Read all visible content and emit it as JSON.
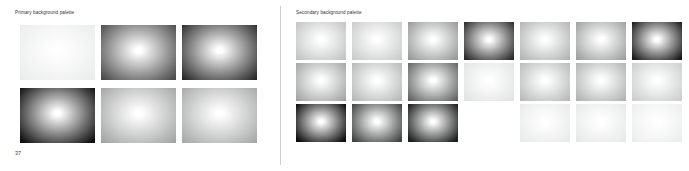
{
  "page": {
    "page_number": "37",
    "background_color": "#ffffff",
    "divider_color": "#cfcfcf"
  },
  "panels": [
    {
      "id": "primary",
      "title": "Primary background palette",
      "columns": 7,
      "swatches": [
        {
          "name": "swatch-1",
          "center": "#ffffff",
          "edge": "#e6e8e7",
          "midstop": 54
        },
        {
          "name": "swatch-2",
          "center": "#ffffff",
          "edge": "#4a4a4a",
          "midstop": 40
        },
        {
          "name": "swatch-3",
          "center": "#ffffff",
          "edge": "#2a2a2a",
          "midstop": 40
        },
        {
          "name": "swatch-4",
          "center": "#ffffff",
          "edge": "#121212",
          "midstop": 38
        },
        {
          "name": "swatch-5",
          "center": "#ffffff",
          "edge": "#9a9c9b",
          "midstop": 46
        },
        {
          "name": "swatch-6",
          "center": "#ffffff",
          "edge": "#9fa1a0",
          "midstop": 46
        }
      ]
    },
    {
      "id": "secondary",
      "title": "Secondary background palette",
      "columns": 7,
      "swatches": [
        {
          "name": "swatch-1",
          "center": "#ffffff",
          "edge": "#b9bcbb",
          "midstop": 48
        },
        {
          "name": "swatch-2",
          "center": "#ffffff",
          "edge": "#c2c4c3",
          "midstop": 48
        },
        {
          "name": "swatch-3",
          "center": "#ffffff",
          "edge": "#8e9190",
          "midstop": 44
        },
        {
          "name": "swatch-4",
          "center": "#ffffff",
          "edge": "#2b2b2b",
          "midstop": 38
        },
        {
          "name": "swatch-5",
          "center": "#ffffff",
          "edge": "#a9acab",
          "midstop": 46
        },
        {
          "name": "swatch-6",
          "center": "#ffffff",
          "edge": "#969998",
          "midstop": 44
        },
        {
          "name": "swatch-7",
          "center": "#ffffff",
          "edge": "#1a1a1a",
          "midstop": 38
        },
        {
          "name": "swatch-8",
          "center": "#ffffff",
          "edge": "#9b9e9d",
          "midstop": 44
        },
        {
          "name": "swatch-9",
          "center": "#ffffff",
          "edge": "#aeb1b0",
          "midstop": 46
        },
        {
          "name": "swatch-10",
          "center": "#ffffff",
          "edge": "#5e6160",
          "midstop": 40
        },
        {
          "name": "swatch-11",
          "center": "#ffffff",
          "edge": "#dcdedd",
          "midstop": 52
        },
        {
          "name": "swatch-12",
          "center": "#ffffff",
          "edge": "#b0b3b2",
          "midstop": 46
        },
        {
          "name": "swatch-13",
          "center": "#ffffff",
          "edge": "#a8abaa",
          "midstop": 46
        },
        {
          "name": "swatch-14",
          "center": "#ffffff",
          "edge": "#c4c7c6",
          "midstop": 48
        },
        {
          "name": "swatch-15",
          "center": "#ffffff",
          "edge": "#111111",
          "midstop": 36
        },
        {
          "name": "swatch-16",
          "center": "#ffffff",
          "edge": "#3f4241",
          "midstop": 38
        },
        {
          "name": "swatch-17",
          "center": "#ffffff",
          "edge": "#1f2120",
          "midstop": 36
        },
        {
          "name": "swatch-18",
          "center": "",
          "edge": "",
          "midstop": 0,
          "empty": true
        },
        {
          "name": "swatch-19",
          "center": "#ffffff",
          "edge": "#e3e5e4",
          "midstop": 54
        },
        {
          "name": "swatch-20",
          "center": "#ffffff",
          "edge": "#e1e3e2",
          "midstop": 54
        },
        {
          "name": "swatch-21",
          "center": "#ffffff",
          "edge": "#e7e9e8",
          "midstop": 55
        }
      ]
    }
  ]
}
